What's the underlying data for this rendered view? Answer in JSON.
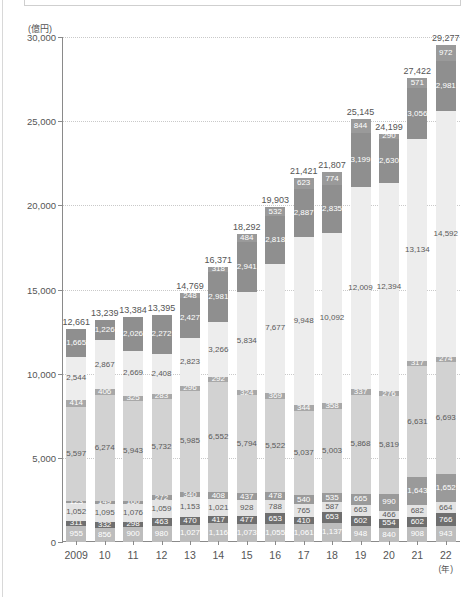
{
  "chart_data": {
    "type": "bar",
    "subtype": "stacked",
    "title": "",
    "xlabel": "(年)",
    "ylabel": "(億円)",
    "unit": "(億円)",
    "ylim": [
      0,
      30000
    ],
    "yticks": [
      0,
      5000,
      10000,
      15000,
      20000,
      25000,
      30000
    ],
    "ytick_labels": [
      "0",
      "5,000",
      "10,000",
      "15,000",
      "20,000",
      "25,000",
      "30,000"
    ],
    "grid": true,
    "legend": "none",
    "categories": [
      "2009",
      "10",
      "11",
      "12",
      "13",
      "14",
      "15",
      "16",
      "17",
      "18",
      "19",
      "20",
      "21",
      "22"
    ],
    "category_suffix": "(年)",
    "totals": [
      12661,
      13239,
      13384,
      13395,
      14769,
      16371,
      18292,
      19903,
      21421,
      21807,
      25145,
      24199,
      27422,
      29277
    ],
    "total_labels": [
      "12,661",
      "13,239",
      "13,384",
      "13,395",
      "14,769",
      "16,371",
      "18,292",
      "19,903",
      "21,421",
      "21,807",
      "25,145",
      "24,199",
      "27,422",
      "29,277"
    ],
    "series": [
      {
        "name": "series-1",
        "color": "#bdbdbd",
        "values": [
          955,
          856,
          900,
          980,
          1027,
          1116,
          1073,
          1055,
          1061,
          1137,
          948,
          840,
          908,
          943
        ],
        "labels": [
          "955",
          "856",
          "900",
          "980",
          "1,027",
          "1,116",
          "1,073",
          "1,055",
          "1,061",
          "1,137",
          "948",
          "840",
          "908",
          "943"
        ]
      },
      {
        "name": "series-2",
        "color": "#6f6f6f",
        "values": [
          311,
          332,
          298,
          463,
          470,
          417,
          477,
          653,
          410,
          653,
          602,
          554,
          602,
          766
        ],
        "labels": [
          "311",
          "332",
          "298",
          "463",
          "470",
          "417",
          "477",
          "653",
          "410",
          "653",
          "602",
          "554",
          "602",
          "766"
        ]
      },
      {
        "name": "series-3",
        "color": "#e3e3e3",
        "values": [
          1052,
          1095,
          1076,
          1059,
          1153,
          1021,
          928,
          788,
          765,
          587,
          663,
          466,
          682,
          664
        ],
        "labels": [
          "1,052",
          "1,095",
          "1,076",
          "1,059",
          "1,153",
          "1,021",
          "928",
          "788",
          "765",
          "587",
          "663",
          "466",
          "682",
          "664"
        ]
      },
      {
        "name": "series-4",
        "color": "#9a9a9a",
        "values": [
          123,
          149,
          160,
          272,
          340,
          408,
          437,
          478,
          540,
          535,
          665,
          990,
          1643,
          1652
        ],
        "labels": [
          "123",
          "149",
          "160",
          "272",
          "340",
          "408",
          "437",
          "478",
          "540",
          "535",
          "665",
          "990",
          "1,643",
          "1,652"
        ]
      },
      {
        "name": "series-5",
        "color": "#d2d2d2",
        "values": [
          5597,
          6274,
          5943,
          5732,
          5985,
          6552,
          5794,
          5522,
          5037,
          5003,
          5868,
          5819,
          6631,
          6693
        ],
        "labels": [
          "5,597",
          "6,274",
          "5,943",
          "5,732",
          "5,985",
          "6,552",
          "5,794",
          "5,522",
          "5,037",
          "5,003",
          "5,868",
          "5,819",
          "6,631",
          "6,693"
        ]
      },
      {
        "name": "series-6",
        "color": "#a8a8a8",
        "values": [
          414,
          406,
          325,
          283,
          296,
          292,
          324,
          369,
          344,
          358,
          337,
          276,
          317,
          274
        ],
        "labels": [
          "414",
          "406",
          "325",
          "283",
          "296",
          "292",
          "324",
          "369",
          "344",
          "358",
          "337",
          "276",
          "317",
          "274"
        ]
      },
      {
        "name": "series-7",
        "color": "#ededed",
        "values": [
          2544,
          2867,
          2669,
          2408,
          2823,
          3266,
          5834,
          7677,
          9948,
          10092,
          12009,
          12394,
          13134,
          14592
        ],
        "labels": [
          "2,544",
          "2,867",
          "2,669",
          "2,408",
          "2,823",
          "3,266",
          "5,834",
          "7,677",
          "9,948",
          "10,092",
          "12,009",
          "12,394",
          "13,134",
          "14,592"
        ]
      },
      {
        "name": "series-8",
        "color": "#8f8f8f",
        "values": [
          1665,
          1226,
          2026,
          2272,
          2427,
          2981,
          2941,
          2818,
          2887,
          2835,
          3199,
          2630,
          3056,
          2981
        ],
        "labels": [
          "1,665",
          "1,226",
          "2,026",
          "2,272",
          "2,427",
          "2,981",
          "2,941",
          "2,818",
          "2,887",
          "2,835",
          "3,199",
          "2,630",
          "3,056",
          "2,981"
        ]
      },
      {
        "name": "series-9",
        "color": "#9a9a9a",
        "values": [
          0,
          0,
          0,
          0,
          248,
          318,
          484,
          532,
          623,
          774,
          844,
          290,
          571,
          972
        ],
        "labels": [
          "",
          "",
          "",
          "",
          "248",
          "318",
          "484",
          "532",
          "623",
          "774",
          "844",
          "290",
          "571",
          "972"
        ]
      }
    ]
  }
}
